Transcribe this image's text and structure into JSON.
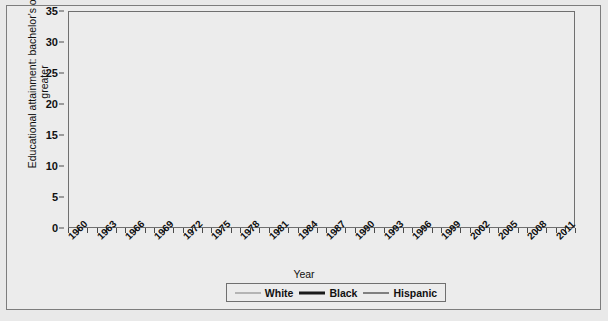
{
  "axes": {
    "ylabel": "Educational attainment: bachelor's or greater",
    "xlabel": "Year",
    "yticks": [
      0,
      5,
      10,
      15,
      20,
      25,
      30,
      35
    ],
    "xtick_labels": [
      1960,
      1963,
      1966,
      1969,
      1972,
      1975,
      1978,
      1981,
      1984,
      1987,
      1990,
      1993,
      1996,
      1999,
      2002,
      2005,
      2008,
      2011
    ]
  },
  "legend": {
    "items": [
      {
        "label": "White",
        "color": "#b4b4b4",
        "width": 2
      },
      {
        "label": "Black",
        "color": "#1a1a1a",
        "width": 3
      },
      {
        "label": "Hispanic",
        "color": "#808080",
        "width": 2
      }
    ]
  },
  "colors": {
    "background": "#ececec",
    "grid": "#8d8d8d",
    "axis": "#6f6f6f",
    "white_series": "#b4b4b4",
    "black_series": "#1a1a1a",
    "hispanic_series": "#808080"
  },
  "chart_data": {
    "type": "line",
    "title": "",
    "xlabel": "Year",
    "ylabel": "Educational attainment: bachelor's or greater",
    "xlim": [
      1960,
      2013
    ],
    "ylim": [
      0,
      35
    ],
    "grid": true,
    "legend_position": "bottom",
    "x": [
      1960,
      1961,
      1962,
      1963,
      1964,
      1965,
      1966,
      1967,
      1968,
      1969,
      1970,
      1971,
      1972,
      1973,
      1974,
      1975,
      1976,
      1977,
      1978,
      1979,
      1980,
      1981,
      1982,
      1983,
      1984,
      1985,
      1986,
      1987,
      1988,
      1989,
      1990,
      1991,
      1992,
      1993,
      1994,
      1995,
      1996,
      1997,
      1998,
      1999,
      2000,
      2001,
      2002,
      2003,
      2004,
      2005,
      2006,
      2007,
      2008,
      2009,
      2010,
      2011,
      2012
    ],
    "series": [
      {
        "name": "White",
        "values": [
          8.1,
          8.4,
          8.7,
          9.0,
          9.4,
          9.7,
          10.1,
          10.6,
          11.0,
          11.5,
          11.9,
          12.4,
          12.9,
          13.4,
          14.0,
          14.5,
          15.1,
          15.6,
          16.1,
          16.6,
          17.2,
          17.7,
          18.2,
          18.7,
          19.2,
          19.7,
          20.2,
          20.7,
          21.2,
          21.7,
          22.2,
          22.7,
          23.1,
          23.6,
          24.1,
          24.6,
          25.1,
          25.6,
          26.0,
          26.5,
          26.8,
          27.0,
          27.2,
          27.5,
          27.8,
          28.2,
          28.6,
          29.0,
          29.3,
          29.6,
          30.0,
          30.4,
          30.8
        ]
      },
      {
        "name": "Black",
        "values": [
          3.1,
          3.2,
          3.3,
          3.4,
          3.5,
          3.6,
          3.8,
          3.9,
          4.0,
          4.2,
          4.5,
          4.8,
          5.2,
          5.5,
          5.9,
          6.3,
          6.6,
          6.9,
          7.2,
          7.5,
          7.9,
          8.1,
          8.4,
          8.6,
          8.9,
          9.2,
          9.5,
          9.8,
          10.1,
          10.5,
          10.9,
          11.2,
          11.6,
          12.0,
          12.5,
          13.0,
          13.5,
          14.0,
          14.4,
          15.0,
          16.4,
          15.6,
          16.0,
          16.4,
          17.0,
          17.1,
          17.4,
          18.0,
          18.5,
          18.8,
          19.1,
          19.8,
          20.2
        ]
      },
      {
        "name": "Hispanic",
        "values": [
          3.0,
          3.1,
          3.2,
          3.3,
          3.4,
          3.5,
          3.7,
          3.8,
          4.0,
          4.1,
          4.4,
          4.7,
          5.1,
          5.4,
          5.8,
          6.2,
          6.5,
          6.8,
          7.1,
          7.4,
          7.8,
          8.0,
          8.2,
          8.4,
          8.6,
          8.8,
          8.9,
          9.0,
          9.1,
          9.2,
          9.3,
          9.3,
          9.3,
          9.3,
          9.3,
          9.3,
          9.3,
          9.8,
          10.2,
          10.5,
          10.9,
          11.0,
          11.1,
          11.5,
          11.8,
          11.9,
          12.2,
          12.6,
          12.9,
          13.0,
          13.2,
          13.5,
          13.7
        ]
      }
    ]
  }
}
